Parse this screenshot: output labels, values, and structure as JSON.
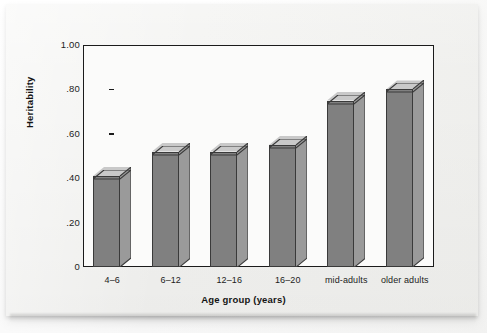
{
  "chart_data": {
    "type": "bar",
    "title": "",
    "xlabel": "Age group (years)",
    "ylabel": "Heritability",
    "categories": [
      "4–6",
      "6–12",
      "12–16",
      "16–20",
      "mid-adults",
      "older adults"
    ],
    "values": [
      0.41,
      0.52,
      0.52,
      0.55,
      0.75,
      0.8
    ],
    "ylim": [
      0,
      1.0
    ],
    "ytick_values": [
      0,
      0.2,
      0.4,
      0.6,
      0.8,
      1.0
    ],
    "ytick_labels": [
      "0",
      ".20",
      ".40",
      ".60",
      ".80",
      "1.00"
    ],
    "grid": false,
    "legend": null,
    "style": "3d-column",
    "colors": {
      "bar_front": "#808080",
      "bar_top": "#c9c9c9",
      "bar_side": "#9a9a9a",
      "bar_outline": "#3a3a3a",
      "axis": "#1b1b1b",
      "plot_background": "#fbfbfa",
      "page_background": "#f3f3f1"
    }
  }
}
